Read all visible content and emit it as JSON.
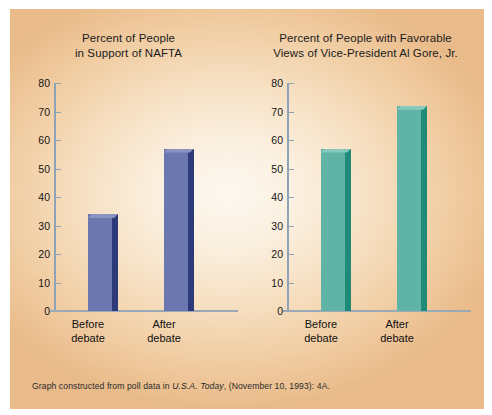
{
  "figure": {
    "source_note_prefix": "Graph constructed from poll data in ",
    "source_publication": "U.S.A. Today",
    "source_note_suffix": ", (November 10, 1993): 4A.",
    "panel_background": "#f1cba1",
    "center_background": "#fdf6ec"
  },
  "chart_data": [
    {
      "type": "bar",
      "id": "nafta-support",
      "title": "Percent of People\nin Support of NAFTA",
      "categories": [
        "Before\ndebate",
        "After\ndebate"
      ],
      "category_labels_flat": [
        "Before debate",
        "After debate"
      ],
      "values": [
        34,
        57
      ],
      "xlabel": "",
      "ylabel": "",
      "ylim": [
        0,
        80
      ],
      "yticks": [
        0,
        10,
        20,
        30,
        40,
        50,
        60,
        70,
        80
      ],
      "grid": false,
      "legend": "none",
      "bar_color": "#6b77ae",
      "bar_side_color": "#2c3a79",
      "bar_top_color": "#8a93c2"
    },
    {
      "type": "bar",
      "id": "gore-favorable",
      "title": "Percent of People with Favorable\nViews of Vice-President Al Gore, Jr.",
      "categories": [
        "Before\ndebate",
        "After\ndebate"
      ],
      "category_labels_flat": [
        "Before debate",
        "After debate"
      ],
      "values": [
        57,
        72
      ],
      "xlabel": "",
      "ylabel": "",
      "ylim": [
        0,
        80
      ],
      "yticks": [
        0,
        10,
        20,
        30,
        40,
        50,
        60,
        70,
        80
      ],
      "grid": false,
      "legend": "none",
      "bar_color": "#5fb4a6",
      "bar_side_color": "#1f8a78",
      "bar_top_color": "#87c9bd"
    }
  ]
}
